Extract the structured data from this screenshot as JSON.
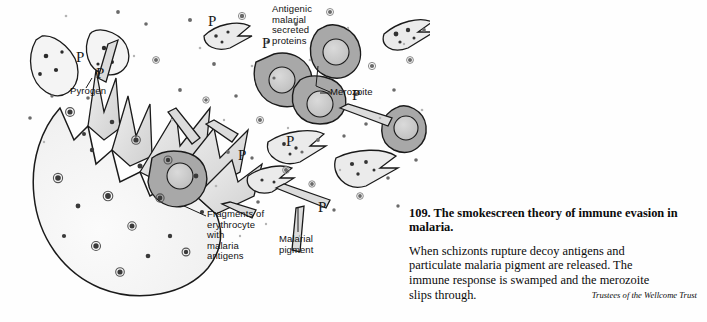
{
  "figure": {
    "labels": {
      "antigenic": "Antigenic\nmalarial\nsecreted\nproteins",
      "pyrogen": "Pyrogen",
      "merozoite": "Merozoite",
      "fragments": "Fragments of\nerythrocyte\nwith\nmalaria\nantigens",
      "pigment": "Malarial\npigment",
      "pyrogen_glyph": "P"
    },
    "colors": {
      "ink": "#111111",
      "cell_fill": "#f2f2f2",
      "infected_fill": "#a8a8a8",
      "nucleus_fill": "#c9c9c9",
      "pigment_fill": "#dcdcdc",
      "merozoite_fill": "#e8e8e8",
      "background": "#fefefe"
    }
  },
  "caption": {
    "number_title": "109. The smokescreen theory of immune evasion in malaria.",
    "body_line1": "When schizonts rupture decoy antigens and",
    "body_line2": "particulate malaria pigment are released. The",
    "body_line3": "immune response is swamped and the merozoite",
    "body_line4": "slips through.",
    "credit": "Trustees of the Wellcome Trust"
  }
}
